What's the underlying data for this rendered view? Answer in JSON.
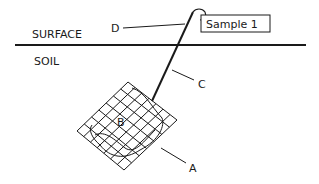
{
  "diagram": {
    "layers": {
      "surface_label": "SURFACE",
      "soil_label": "SOIL"
    },
    "sample_label": "Sample 1",
    "callouts": {
      "a": "A",
      "b": "B",
      "c": "C",
      "d": "D"
    },
    "colors": {
      "ink": "#1a1a1a",
      "background": "#ffffff"
    }
  }
}
